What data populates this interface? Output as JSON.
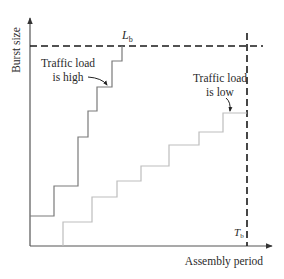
{
  "diagram": {
    "y_axis_label": "Burst size",
    "x_axis_label": "Assembly period",
    "threshold_length": {
      "symbol": "L",
      "subscript": "b"
    },
    "threshold_time": {
      "symbol": "T",
      "subscript": "b"
    },
    "high_load_label": {
      "line1": "Traffic load",
      "line2": "is high"
    },
    "low_load_label": {
      "line1": "Traffic load",
      "line2": "is low"
    },
    "colors": {
      "axis": "#555555",
      "threshold": "#1a1a1a",
      "high_load_curve": "#7a7a7a",
      "low_load_curve": "#bdbdbd",
      "text": "#2a2a2a"
    }
  }
}
